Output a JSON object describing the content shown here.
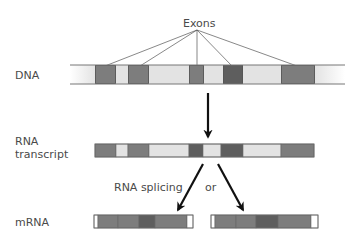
{
  "labels": {
    "exons": "Exons",
    "dna": "DNA",
    "rna_line1": "RNA",
    "rna_line2": "transcript",
    "splicing": "RNA splicing",
    "or": "or",
    "mrna": "mRNA"
  },
  "colors": {
    "exon": "#7d7d7d",
    "exon_dark": "#5e5e5e",
    "intron": "#e3e3e3",
    "cap": "#ffffff",
    "outline": "#6a6a6a",
    "arrow": "#111111",
    "pointer_line": "#555555"
  },
  "dna": {
    "x_start": 70,
    "x_end": 345,
    "y": 65,
    "height": 19,
    "segments": [
      {
        "type": "intron",
        "x": 70,
        "w": 25
      },
      {
        "type": "exon",
        "x": 95,
        "w": 21
      },
      {
        "type": "intron",
        "x": 116,
        "w": 12
      },
      {
        "type": "exon",
        "x": 128,
        "w": 21
      },
      {
        "type": "intron",
        "x": 149,
        "w": 40
      },
      {
        "type": "exon",
        "x": 189,
        "w": 15
      },
      {
        "type": "intron",
        "x": 204,
        "w": 19
      },
      {
        "type": "exon_dark",
        "x": 223,
        "w": 20
      },
      {
        "type": "intron",
        "x": 243,
        "w": 38
      },
      {
        "type": "exon",
        "x": 281,
        "w": 34
      },
      {
        "type": "intron",
        "x": 315,
        "w": 30
      }
    ]
  },
  "exon_pointers": {
    "origin": [
      197,
      30
    ],
    "targets": [
      [
        105,
        66
      ],
      [
        140,
        66
      ],
      [
        197,
        66
      ],
      [
        232,
        66
      ],
      [
        297,
        66
      ]
    ]
  },
  "rna_transcript": {
    "y": 144,
    "height": 13,
    "segments": [
      {
        "type": "exon",
        "x": 95,
        "w": 21
      },
      {
        "type": "intron",
        "x": 116,
        "w": 12
      },
      {
        "type": "exon",
        "x": 128,
        "w": 21
      },
      {
        "type": "intron",
        "x": 149,
        "w": 40
      },
      {
        "type": "exon_dark",
        "x": 189,
        "w": 14
      },
      {
        "type": "intron",
        "x": 203,
        "w": 18
      },
      {
        "type": "exon_dark",
        "x": 221,
        "w": 22
      },
      {
        "type": "intron",
        "x": 243,
        "w": 38
      },
      {
        "type": "exon",
        "x": 281,
        "w": 33
      }
    ]
  },
  "mrna_variants": [
    {
      "y": 215,
      "height": 13,
      "segments": [
        {
          "type": "cap",
          "x": 94,
          "w": 4
        },
        {
          "type": "exon",
          "x": 98,
          "w": 20
        },
        {
          "type": "exon",
          "x": 118,
          "w": 21
        },
        {
          "type": "exon_dark",
          "x": 139,
          "w": 16
        },
        {
          "type": "exon",
          "x": 155,
          "w": 32
        },
        {
          "type": "cap",
          "x": 187,
          "w": 6
        }
      ]
    },
    {
      "y": 215,
      "height": 13,
      "segments": [
        {
          "type": "cap",
          "x": 211,
          "w": 4
        },
        {
          "type": "exon",
          "x": 215,
          "w": 21
        },
        {
          "type": "exon",
          "x": 236,
          "w": 20
        },
        {
          "type": "exon_dark",
          "x": 256,
          "w": 22
        },
        {
          "type": "exon",
          "x": 278,
          "w": 33
        },
        {
          "type": "cap",
          "x": 311,
          "w": 7
        }
      ]
    }
  ],
  "arrows": {
    "transcription": {
      "from": [
        208,
        93
      ],
      "to": [
        208,
        137
      ]
    },
    "splice_left": {
      "from": [
        203,
        164
      ],
      "to": [
        178,
        210
      ]
    },
    "splice_right": {
      "from": [
        218,
        164
      ],
      "to": [
        243,
        210
      ]
    }
  }
}
